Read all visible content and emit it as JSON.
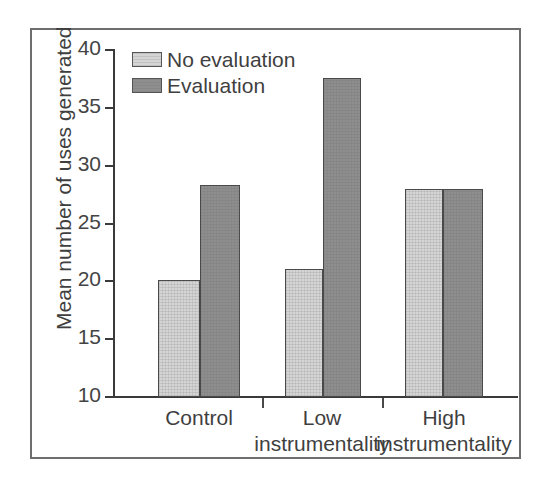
{
  "figure": {
    "background_color": "#ffffff",
    "frame_color": "#6e6e6e",
    "axis_color": "#3a3a3a"
  },
  "legend": {
    "position": "top-left-inside",
    "entries": [
      {
        "label": "No evaluation",
        "color": "#d5d5d5",
        "swatch": "light-gray-swatch"
      },
      {
        "label": "Evaluation",
        "color": "#8e8e8e",
        "swatch": "dark-gray-swatch"
      }
    ]
  },
  "axes": {
    "y_title": "Mean number of uses generated",
    "y_ticks": [
      "40",
      "35",
      "30",
      "25",
      "20",
      "15",
      "10"
    ],
    "x_labels": [
      {
        "line1": "Control",
        "line2": ""
      },
      {
        "line1": "Low",
        "line2": "instrumentality"
      },
      {
        "line1": "High",
        "line2": "instrumentality"
      }
    ]
  },
  "chart_data": {
    "type": "bar",
    "title": "",
    "xlabel": "",
    "ylabel": "Mean number of uses generated",
    "categories": [
      "Control",
      "Low instrumentality",
      "High instrumentality"
    ],
    "series": [
      {
        "name": "No evaluation",
        "values": [
          20.1,
          21.1,
          28.0
        ],
        "color": "#d5d5d5"
      },
      {
        "name": "Evaluation",
        "values": [
          28.3,
          37.6,
          28.0
        ],
        "color": "#8e8e8e"
      }
    ],
    "ylim": [
      10,
      40
    ],
    "yticks": [
      10,
      15,
      20,
      25,
      30,
      35,
      40
    ],
    "grid": false,
    "legend_position": "upper left"
  }
}
